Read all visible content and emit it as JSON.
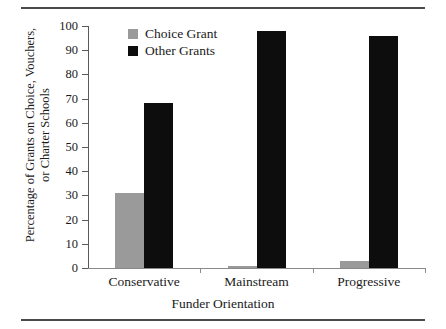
{
  "chart_data": {
    "type": "bar",
    "title": "",
    "xlabel": "Funder Orientation",
    "ylabel": "Percentage of Grants on Choice, Vouchers, or Charter Schools",
    "ylabel_line1": "Percentage of Grants on Choice, Vouchers,",
    "ylabel_line2": "or Charter Schools",
    "categories": [
      "Conservative",
      "Mainstream",
      "Progressive"
    ],
    "series": [
      {
        "name": "Choice Grant",
        "color": "#9a9a9a",
        "values": [
          31,
          1,
          3
        ]
      },
      {
        "name": "Other Grants",
        "color": "#0d0d0d",
        "values": [
          68,
          98,
          96
        ]
      }
    ],
    "ylim": [
      0,
      100
    ],
    "yticks": [
      0,
      10,
      20,
      30,
      40,
      50,
      60,
      70,
      80,
      90,
      100
    ],
    "ytick_labels": [
      "0",
      "10",
      "20",
      "30",
      "40",
      "50",
      "60",
      "70",
      "80",
      "90",
      "100"
    ],
    "grid": false,
    "legend_position": "top-left-inside"
  },
  "legend": {
    "items": [
      {
        "label": "Choice Grant",
        "color": "#9a9a9a"
      },
      {
        "label": "Other Grants",
        "color": "#0d0d0d"
      }
    ]
  }
}
